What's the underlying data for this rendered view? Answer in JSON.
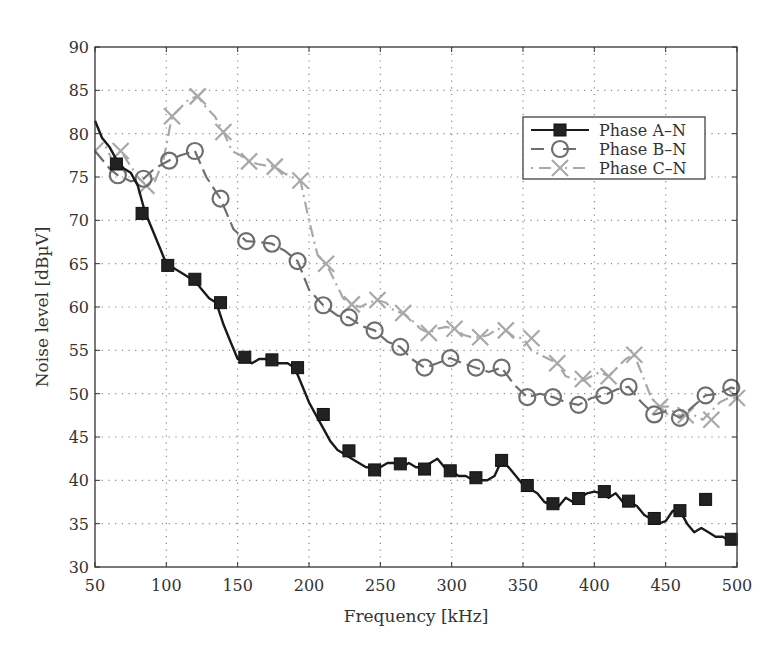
{
  "chart_data": {
    "type": "line",
    "title": "",
    "xlabel": "Frequency [kHz]",
    "ylabel": "Noise level [dBµV]",
    "xlim": [
      50,
      500
    ],
    "ylim": [
      30,
      90
    ],
    "xticks": [
      50,
      100,
      150,
      200,
      250,
      300,
      350,
      400,
      450,
      500
    ],
    "yticks": [
      30,
      35,
      40,
      45,
      50,
      55,
      60,
      65,
      70,
      75,
      80,
      85,
      90
    ],
    "grid": true,
    "legend_position": "top-right",
    "series": [
      {
        "name": "Phase A–N",
        "color": "#1a1a1a",
        "marker": "square",
        "line_style": "solid",
        "x": [
          50,
          55,
          60,
          65,
          70,
          75,
          80,
          85,
          90,
          95,
          100,
          105,
          110,
          115,
          120,
          125,
          130,
          135,
          140,
          145,
          150,
          155,
          160,
          165,
          170,
          175,
          180,
          185,
          190,
          195,
          200,
          205,
          210,
          215,
          220,
          225,
          230,
          235,
          240,
          245,
          250,
          255,
          260,
          265,
          270,
          275,
          280,
          285,
          290,
          295,
          300,
          305,
          310,
          315,
          320,
          325,
          330,
          335,
          340,
          345,
          350,
          355,
          360,
          365,
          370,
          375,
          380,
          385,
          390,
          395,
          400,
          405,
          410,
          415,
          420,
          425,
          430,
          435,
          440,
          445,
          450,
          455,
          460,
          465,
          470,
          475,
          480,
          485,
          490,
          495,
          500
        ],
        "y": [
          81.5,
          79.5,
          78.5,
          77,
          76,
          75.5,
          74,
          71,
          69,
          67,
          65,
          64.5,
          64,
          63.5,
          63,
          62,
          61,
          60.5,
          58,
          56,
          54,
          54,
          53.5,
          54,
          54,
          53.5,
          53.5,
          53.5,
          53,
          51,
          49,
          47.5,
          46,
          44.5,
          43.5,
          43,
          42.5,
          42,
          41.5,
          41.5,
          41.5,
          42,
          42,
          41.5,
          42,
          41.5,
          41.5,
          42,
          42.5,
          41.5,
          41,
          40.5,
          40.5,
          40,
          40,
          40,
          40.5,
          42.3,
          41.5,
          40.5,
          39.5,
          39,
          38.5,
          37.5,
          37.2,
          37,
          38,
          37.5,
          38,
          38.5,
          38.7,
          38.5,
          38,
          38.5,
          37.5,
          37.5,
          37,
          36,
          35.5,
          35,
          35.3,
          36.5,
          36.5,
          35,
          34,
          34.5,
          34,
          33.5,
          33.5,
          33,
          33
        ],
        "marker_x": [
          65,
          83,
          101,
          120,
          138,
          155,
          174,
          192,
          210,
          228,
          246,
          264,
          281,
          299,
          317,
          335,
          353,
          371,
          389,
          407,
          424,
          442,
          460,
          478,
          496
        ],
        "marker_y": [
          76.5,
          70.8,
          64.8,
          63.2,
          60.5,
          54.2,
          53.9,
          53.0,
          47.6,
          43.4,
          41.2,
          41.9,
          41.3,
          41.1,
          40.3,
          42.3,
          39.4,
          37.3,
          37.9,
          38.7,
          37.6,
          35.6,
          36.5,
          37.8,
          33.2
        ]
      },
      {
        "name": "Phase B–N",
        "color": "#6e6e6e",
        "marker": "circle",
        "line_style": "dashed",
        "x": [
          50,
          60,
          66,
          75,
          84,
          92,
          102,
          110,
          120,
          128,
          138,
          147,
          156,
          165,
          174,
          183,
          192,
          200,
          210,
          220,
          228,
          237,
          246,
          255,
          264,
          272,
          281,
          290,
          299,
          308,
          317,
          326,
          335,
          344,
          353,
          362,
          371,
          380,
          389,
          398,
          407,
          416,
          424,
          433,
          442,
          451,
          460,
          469,
          478,
          487,
          496,
          500
        ],
        "y": [
          78,
          76,
          75.2,
          74.5,
          74.8,
          76,
          76.9,
          77.5,
          78,
          75,
          72.5,
          69,
          67.6,
          67.5,
          67.3,
          66.5,
          65.3,
          62,
          60.2,
          59,
          58.8,
          57.8,
          57.3,
          56,
          55.4,
          54,
          53,
          53.5,
          54.1,
          53.5,
          53,
          52.5,
          53,
          51,
          49.6,
          50,
          49.6,
          49,
          48.7,
          49.5,
          49.8,
          50.5,
          50.8,
          49,
          47.6,
          48,
          47.2,
          48.5,
          49.8,
          50,
          50.7,
          50.5
        ],
        "marker_x": [
          66,
          84,
          102,
          120,
          138,
          156,
          174,
          192,
          210,
          228,
          246,
          264,
          281,
          299,
          317,
          335,
          353,
          371,
          389,
          407,
          424,
          442,
          460,
          478,
          496
        ],
        "marker_y": [
          75.2,
          74.8,
          76.9,
          78.0,
          72.5,
          67.6,
          67.3,
          65.3,
          60.2,
          58.8,
          57.3,
          55.4,
          53.0,
          54.1,
          53.0,
          53.0,
          49.6,
          49.6,
          48.7,
          49.8,
          50.8,
          47.6,
          47.2,
          49.8,
          50.7
        ]
      },
      {
        "name": "Phase C–N",
        "color": "#a8a8a8",
        "marker": "x",
        "line_style": "dash-dot",
        "x": [
          50,
          56,
          62,
          68,
          74,
          80,
          86,
          92,
          98,
          104,
          110,
          116,
          122,
          128,
          134,
          140,
          146,
          152,
          158,
          164,
          170,
          176,
          182,
          188,
          194,
          200,
          206,
          212,
          218,
          224,
          230,
          236,
          242,
          248,
          254,
          260,
          266,
          272,
          278,
          284,
          290,
          296,
          302,
          308,
          314,
          320,
          326,
          332,
          338,
          344,
          350,
          356,
          362,
          368,
          374,
          380,
          386,
          392,
          398,
          404,
          410,
          416,
          422,
          428,
          434,
          440,
          446,
          452,
          458,
          464,
          470,
          476,
          482,
          488,
          494,
          500
        ],
        "y": [
          78,
          79,
          77,
          78,
          76.5,
          75,
          74,
          74.5,
          77,
          82,
          83,
          84,
          84.3,
          83,
          82,
          80.2,
          78,
          77.5,
          76.8,
          76.5,
          76.3,
          76.2,
          75.5,
          75,
          74.6,
          70,
          66,
          65,
          63,
          61,
          60.3,
          60,
          60.5,
          60.8,
          60.5,
          59.5,
          59.3,
          58.5,
          57.5,
          57,
          57.5,
          57.7,
          57.5,
          56.8,
          56.5,
          56.5,
          56.8,
          57.5,
          57.3,
          56.5,
          56.4,
          55,
          54.5,
          54,
          53.5,
          52,
          51.7,
          51.5,
          52,
          52.5,
          52,
          53,
          54,
          54.5,
          52,
          49.5,
          48.5,
          48.5,
          47.5,
          47.5,
          47.5,
          47,
          48,
          49,
          49.5,
          49.5
        ],
        "marker_x": [
          68,
          86,
          104,
          122,
          140,
          158,
          176,
          194,
          212,
          230,
          248,
          266,
          284,
          302,
          320,
          338,
          356,
          374,
          392,
          410,
          428,
          446,
          464,
          482,
          500
        ],
        "marker_y": [
          78.0,
          74.0,
          82.0,
          84.3,
          80.2,
          76.8,
          76.2,
          74.6,
          65.0,
          60.3,
          60.8,
          59.3,
          57.0,
          57.5,
          56.5,
          57.3,
          56.4,
          53.5,
          51.7,
          52.0,
          54.5,
          48.5,
          47.5,
          47.0,
          49.5
        ]
      }
    ]
  }
}
